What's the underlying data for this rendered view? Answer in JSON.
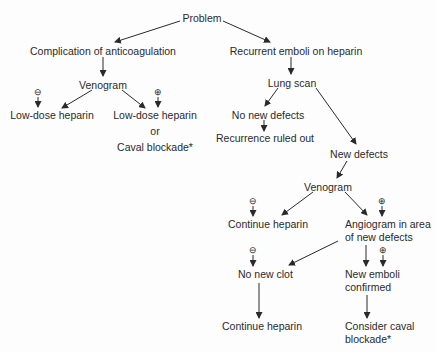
{
  "diagram": {
    "type": "flowchart",
    "nodes": {
      "problem": "Problem",
      "complication": "Complication of anticoagulation",
      "venogram_left": "Venogram",
      "low_dose_neg": "Low-dose heparin",
      "low_dose_pos": "Low-dose heparin",
      "or": "or",
      "caval_blockade_left": "Caval blockade*",
      "recurrent": "Recurrent emboli on heparin",
      "lung_scan": "Lung scan",
      "no_new_defects": "No new defects",
      "recurrence_ruled_out": "Recurrence ruled out",
      "new_defects": "New defects",
      "venogram_right": "Venogram",
      "continue_heparin_1": "Continue heparin",
      "angiogram_line1": "Angiogram in area",
      "angiogram_line2": "of new defects",
      "no_new_clot": "No new clot",
      "new_emboli_line1": "New emboli",
      "new_emboli_line2": "confirmed",
      "continue_heparin_2": "Continue heparin",
      "consider_caval_line1": "Consider caval",
      "consider_caval_line2": "blockade*"
    },
    "signs": {
      "negative": "⊖",
      "positive": "⊕"
    },
    "edges": [
      [
        "problem",
        "complication"
      ],
      [
        "problem",
        "recurrent"
      ],
      [
        "complication",
        "venogram_left"
      ],
      [
        "venogram_left",
        "low_dose_neg",
        "negative"
      ],
      [
        "venogram_left",
        "low_dose_pos",
        "positive"
      ],
      [
        "recurrent",
        "lung_scan"
      ],
      [
        "lung_scan",
        "no_new_defects"
      ],
      [
        "lung_scan",
        "new_defects"
      ],
      [
        "no_new_defects",
        "recurrence_ruled_out"
      ],
      [
        "new_defects",
        "venogram_right"
      ],
      [
        "venogram_right",
        "continue_heparin_1",
        "negative"
      ],
      [
        "venogram_right",
        "angiogram",
        "positive"
      ],
      [
        "angiogram",
        "no_new_clot",
        "negative"
      ],
      [
        "angiogram",
        "new_emboli",
        "positive"
      ],
      [
        "no_new_clot",
        "continue_heparin_2"
      ],
      [
        "new_emboli",
        "consider_caval"
      ]
    ]
  }
}
